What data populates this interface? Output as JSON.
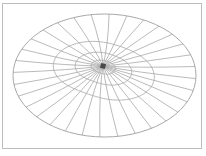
{
  "diagram": {
    "type": "elliptical-radial-mesh",
    "ellipse": {
      "cx": 104.5,
      "cy": 75.5,
      "rx": 91.5,
      "ry": 61.5
    },
    "center_point": {
      "x": 103,
      "y": 66,
      "size": 5
    },
    "spoke_count": 32,
    "ring_fractions": [
      0.12,
      0.28,
      0.5
    ],
    "colors": {
      "line": "#a8a8a8",
      "frame": "#bdbdbd",
      "center": "#4a4a4a",
      "background": "#ffffff"
    }
  }
}
